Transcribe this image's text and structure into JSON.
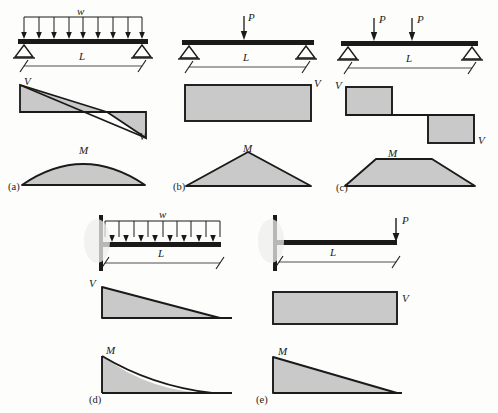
{
  "figure": {
    "background_color": "#fdfdfc",
    "fill_color": "#c9c9c9",
    "line_color": "#1a1a1a",
    "panel_count": 5
  },
  "labels": {
    "w": "w",
    "P": "P",
    "L": "L",
    "V": "V",
    "M": "M"
  },
  "panels": [
    {
      "key": "a",
      "caption": "(a)",
      "load_label": "w",
      "load_type": "uniform-distributed",
      "span_label": "L",
      "left_support": "pin",
      "right_support": "pin",
      "shear_label_left": "V",
      "shear_label_right": "V",
      "moment_label": "M",
      "shear_shape": "linear-crossing",
      "moment_shape": "parabola"
    },
    {
      "key": "b",
      "caption": "(b)",
      "load_label": "P",
      "load_type": "point-center",
      "span_label": "L",
      "left_support": "pin",
      "right_support": "pin",
      "shear_label_right": "V",
      "moment_label": "M",
      "shear_shape": "rectangle",
      "moment_shape": "triangle"
    },
    {
      "key": "c",
      "caption": "(c)",
      "load_label_1": "P",
      "load_label_2": "P",
      "load_type": "two-point-loads",
      "span_label": "L",
      "left_support": "pin",
      "right_support": "pin",
      "shear_label_left": "V",
      "shear_label_right": "V",
      "moment_label": "M",
      "shear_shape": "step",
      "moment_shape": "trapezoid"
    },
    {
      "key": "d",
      "caption": "(d)",
      "load_label": "w",
      "load_type": "uniform-distributed-cantilever",
      "span_label": "L",
      "left_support": "fixed",
      "right_support": "free",
      "shear_label_left": "V",
      "moment_label": "M",
      "shear_shape": "triangle",
      "moment_shape": "parabola-concave"
    },
    {
      "key": "e",
      "caption": "(e)",
      "load_label": "P",
      "load_type": "point-end-cantilever",
      "span_label": "L",
      "left_support": "fixed",
      "right_support": "free",
      "shear_label_right": "V",
      "moment_label": "M",
      "shear_shape": "rectangle",
      "moment_shape": "triangle"
    }
  ]
}
